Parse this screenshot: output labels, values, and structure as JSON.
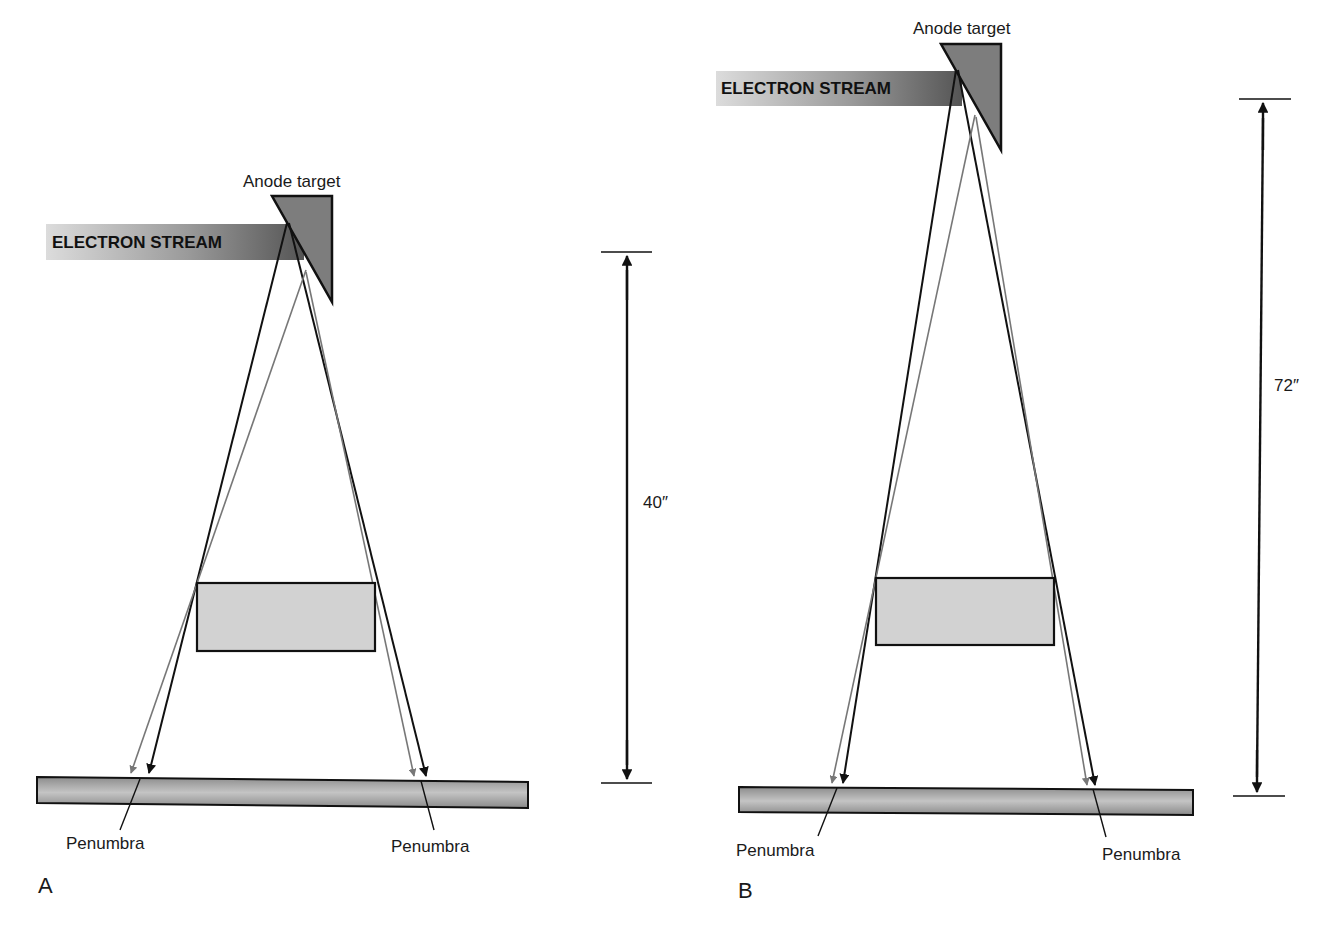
{
  "figure": {
    "panels": [
      {
        "id": "A",
        "panel_label": "A",
        "anode_label": "Anode target",
        "electron_stream_label": "ELECTRON STREAM",
        "distance_label": "40″",
        "penumbra_left_label": "Penumbra",
        "penumbra_right_label": "Penumbra"
      },
      {
        "id": "B",
        "panel_label": "B",
        "anode_label": "Anode target",
        "electron_stream_label": "ELECTRON STREAM",
        "distance_label": "72″",
        "penumbra_left_label": "Penumbra",
        "penumbra_right_label": "Penumbra"
      }
    ],
    "colors": {
      "ray_primary": "#111111",
      "ray_secondary": "#777777",
      "anode_fill": "#7d7d7d",
      "object_fill": "#d2d2d2",
      "receptor_fill": "#a8a8a8",
      "stream_dark": "#5a5a5a",
      "stream_light": "#d8d8d8",
      "outline": "#111111"
    }
  }
}
